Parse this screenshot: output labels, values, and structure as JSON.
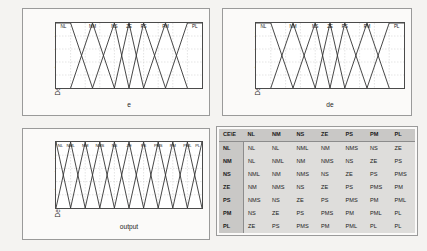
{
  "figure": {
    "background_color": "#f4f3f1",
    "panel_background": "#fbfaf9"
  },
  "charts": [
    {
      "id": "error",
      "chart_data": {
        "type": "line",
        "title": "",
        "xlabel": "e",
        "ylabel": "Degree of membership",
        "xlim": [
          -1,
          1
        ],
        "ylim": [
          0,
          1
        ],
        "xticks": [
          "-1",
          "-0.8",
          "-0.6",
          "-0.4",
          "-0.2",
          "0",
          "0.2",
          "0.4",
          "0.6",
          "0.8",
          "1"
        ],
        "xtick_values": [
          -1,
          -0.8,
          -0.6,
          -0.4,
          -0.2,
          0,
          0.2,
          0.4,
          0.6,
          0.8,
          1
        ],
        "yticks": [
          "0",
          "0.2",
          "0.4",
          "0.6",
          "0.8",
          "1"
        ],
        "ytick_values": [
          0,
          0.2,
          0.4,
          0.6,
          0.8,
          1
        ],
        "grid": true,
        "legend_position": "top-inline",
        "series": [
          {
            "name": "NL",
            "type": "trapezoid",
            "points": [
              [
                -1,
                1
              ],
              [
                -0.8,
                1
              ],
              [
                -0.5,
                0
              ]
            ]
          },
          {
            "name": "NM",
            "type": "triangle",
            "points": [
              [
                -0.8,
                0
              ],
              [
                -0.5,
                1
              ],
              [
                -0.2,
                0
              ]
            ]
          },
          {
            "name": "NS",
            "type": "triangle",
            "points": [
              [
                -0.5,
                0
              ],
              [
                -0.2,
                1
              ],
              [
                0,
                0
              ]
            ]
          },
          {
            "name": "ZE",
            "type": "triangle",
            "points": [
              [
                -0.2,
                0
              ],
              [
                0,
                1
              ],
              [
                0.2,
                0
              ]
            ]
          },
          {
            "name": "PS",
            "type": "triangle",
            "points": [
              [
                0,
                0
              ],
              [
                0.2,
                1
              ],
              [
                0.5,
                0
              ]
            ]
          },
          {
            "name": "PM",
            "type": "triangle",
            "points": [
              [
                0.2,
                0
              ],
              [
                0.5,
                1
              ],
              [
                0.8,
                0
              ]
            ]
          },
          {
            "name": "PL",
            "type": "trapezoid",
            "points": [
              [
                0.5,
                0
              ],
              [
                0.8,
                1
              ],
              [
                1,
                1
              ]
            ]
          }
        ],
        "labels": [
          {
            "text": "NL",
            "x": -0.9
          },
          {
            "text": "NM",
            "x": -0.5
          },
          {
            "text": "NS",
            "x": -0.2
          },
          {
            "text": "ZE",
            "x": 0
          },
          {
            "text": "PS",
            "x": 0.2
          },
          {
            "text": "PM",
            "x": 0.5
          },
          {
            "text": "PL",
            "x": 0.9
          }
        ]
      }
    },
    {
      "id": "change-of-error",
      "chart_data": {
        "type": "line",
        "title": "",
        "xlabel": "de",
        "ylabel": "Degree of membership",
        "xlim": [
          -1,
          1
        ],
        "ylim": [
          0,
          1
        ],
        "xticks": [
          "-1",
          "-0.8",
          "-0.6",
          "-0.4",
          "-0.2",
          "0",
          "0.2",
          "0.4",
          "0.6",
          "0.8",
          "1"
        ],
        "xtick_values": [
          -1,
          -0.8,
          -0.6,
          -0.4,
          -0.2,
          0,
          0.2,
          0.4,
          0.6,
          0.8,
          1
        ],
        "yticks": [
          "0",
          "0.2",
          "0.4",
          "0.6",
          "0.8",
          "1"
        ],
        "ytick_values": [
          0,
          0.2,
          0.4,
          0.6,
          0.8,
          1
        ],
        "grid": true,
        "legend_position": "top-inline",
        "series": [
          {
            "name": "NL",
            "type": "trapezoid",
            "points": [
              [
                -1,
                1
              ],
              [
                -0.8,
                1
              ],
              [
                -0.5,
                0
              ]
            ]
          },
          {
            "name": "NM",
            "type": "triangle",
            "points": [
              [
                -0.8,
                0
              ],
              [
                -0.5,
                1
              ],
              [
                -0.2,
                0
              ]
            ]
          },
          {
            "name": "NS",
            "type": "triangle",
            "points": [
              [
                -0.5,
                0
              ],
              [
                -0.2,
                1
              ],
              [
                0,
                0
              ]
            ]
          },
          {
            "name": "ZE",
            "type": "triangle",
            "points": [
              [
                -0.2,
                0
              ],
              [
                0,
                1
              ],
              [
                0.2,
                0
              ]
            ]
          },
          {
            "name": "PS",
            "type": "triangle",
            "points": [
              [
                0,
                0
              ],
              [
                0.2,
                1
              ],
              [
                0.5,
                0
              ]
            ]
          },
          {
            "name": "PM",
            "type": "triangle",
            "points": [
              [
                0.2,
                0
              ],
              [
                0.5,
                1
              ],
              [
                0.8,
                0
              ]
            ]
          },
          {
            "name": "PL",
            "type": "trapezoid",
            "points": [
              [
                0.5,
                0
              ],
              [
                0.8,
                1
              ],
              [
                1,
                1
              ]
            ]
          }
        ],
        "labels": [
          {
            "text": "NL",
            "x": -0.9
          },
          {
            "text": "NM",
            "x": -0.5
          },
          {
            "text": "NS",
            "x": -0.2
          },
          {
            "text": "ZE",
            "x": 0
          },
          {
            "text": "PS",
            "x": 0.2
          },
          {
            "text": "PM",
            "x": 0.5
          },
          {
            "text": "PL",
            "x": 0.9
          }
        ]
      }
    },
    {
      "id": "output",
      "chart_data": {
        "type": "line",
        "title": "",
        "xlabel": "output",
        "ylabel": "Degree of membership",
        "xlim": [
          -1,
          1
        ],
        "ylim": [
          0,
          1
        ],
        "xticks": [
          "-1",
          "-0.8",
          "-0.6",
          "-0.4",
          "-0.2",
          "0",
          "0.2",
          "0.4",
          "0.6",
          "0.8",
          "1"
        ],
        "xtick_values": [
          -1,
          -0.8,
          -0.6,
          -0.4,
          -0.2,
          0,
          0.2,
          0.4,
          0.6,
          0.8,
          1
        ],
        "yticks": [
          "0",
          "0.2",
          "0.4",
          "0.6",
          "0.8",
          "1"
        ],
        "ytick_values": [
          0,
          0.2,
          0.4,
          0.6,
          0.8,
          1
        ],
        "grid": true,
        "legend_position": "top-inline",
        "series": [
          {
            "name": "NL",
            "type": "triangle",
            "points": [
              [
                -1.2,
                0
              ],
              [
                -1,
                1
              ],
              [
                -0.8,
                0
              ]
            ]
          },
          {
            "name": "NML",
            "type": "triangle",
            "points": [
              [
                -1,
                0
              ],
              [
                -0.8,
                1
              ],
              [
                -0.6,
                0
              ]
            ]
          },
          {
            "name": "NM",
            "type": "triangle",
            "points": [
              [
                -0.8,
                0
              ],
              [
                -0.6,
                1
              ],
              [
                -0.4,
                0
              ]
            ]
          },
          {
            "name": "NMS",
            "type": "triangle",
            "points": [
              [
                -0.6,
                0
              ],
              [
                -0.4,
                1
              ],
              [
                -0.2,
                0
              ]
            ]
          },
          {
            "name": "NS",
            "type": "triangle",
            "points": [
              [
                -0.4,
                0
              ],
              [
                -0.2,
                1
              ],
              [
                0,
                0
              ]
            ]
          },
          {
            "name": "ZE",
            "type": "triangle",
            "points": [
              [
                -0.2,
                0
              ],
              [
                0,
                1
              ],
              [
                0.2,
                0
              ]
            ]
          },
          {
            "name": "PS",
            "type": "triangle",
            "points": [
              [
                0,
                0
              ],
              [
                0.2,
                1
              ],
              [
                0.4,
                0
              ]
            ]
          },
          {
            "name": "PMS",
            "type": "triangle",
            "points": [
              [
                0.2,
                0
              ],
              [
                0.4,
                1
              ],
              [
                0.6,
                0
              ]
            ]
          },
          {
            "name": "PM",
            "type": "triangle",
            "points": [
              [
                0.4,
                0
              ],
              [
                0.6,
                1
              ],
              [
                0.8,
                0
              ]
            ]
          },
          {
            "name": "PML",
            "type": "triangle",
            "points": [
              [
                0.6,
                0
              ],
              [
                0.8,
                1
              ],
              [
                1,
                0
              ]
            ]
          },
          {
            "name": "PL",
            "type": "triangle",
            "points": [
              [
                0.8,
                0
              ],
              [
                1,
                1
              ],
              [
                1.2,
                0
              ]
            ]
          }
        ],
        "labels": [
          {
            "text": "NL",
            "x": -1.0
          },
          {
            "text": "NML",
            "x": -0.8
          },
          {
            "text": "NM",
            "x": -0.6
          },
          {
            "text": "NMS",
            "x": -0.4
          },
          {
            "text": "NS",
            "x": -0.2
          },
          {
            "text": "ZE",
            "x": 0
          },
          {
            "text": "PS",
            "x": 0.2
          },
          {
            "text": "PMS",
            "x": 0.4
          },
          {
            "text": "PM",
            "x": 0.6
          },
          {
            "text": "PML",
            "x": 0.8
          },
          {
            "text": "PL",
            "x": 1.0
          }
        ]
      }
    }
  ],
  "rule_table": {
    "corner_label": "CE\\E",
    "columns": [
      "NL",
      "NM",
      "NS",
      "ZE",
      "PS",
      "PM",
      "PL"
    ],
    "rows": [
      {
        "header": "NL",
        "cells": [
          "NL",
          "NL",
          "NML",
          "NM",
          "NMS",
          "NS",
          "ZE"
        ]
      },
      {
        "header": "NM",
        "cells": [
          "NL",
          "NML",
          "NM",
          "NMS",
          "NS",
          "ZE",
          "PS"
        ]
      },
      {
        "header": "NS",
        "cells": [
          "NML",
          "NM",
          "NMS",
          "NS",
          "ZE",
          "PS",
          "PMS"
        ]
      },
      {
        "header": "ZE",
        "cells": [
          "NM",
          "NMS",
          "NS",
          "ZE",
          "PS",
          "PMS",
          "PM"
        ]
      },
      {
        "header": "PS",
        "cells": [
          "NMS",
          "NS",
          "ZE",
          "PS",
          "PMS",
          "PM",
          "PML"
        ]
      },
      {
        "header": "PM",
        "cells": [
          "NS",
          "ZE",
          "PS",
          "PMS",
          "PM",
          "PML",
          "PL"
        ]
      },
      {
        "header": "PL",
        "cells": [
          "ZE",
          "PS",
          "PMS",
          "PM",
          "PML",
          "PL",
          "PL"
        ]
      }
    ]
  }
}
